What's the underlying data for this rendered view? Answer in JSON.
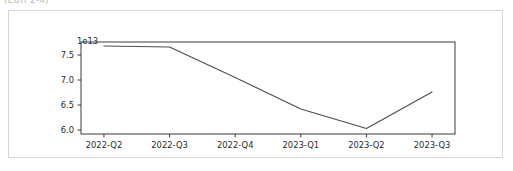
{
  "caption": {
    "clipped_text": "(EUR 2-4)"
  },
  "chart_data": {
    "type": "line",
    "title": "",
    "subtitle": "",
    "xlabel": "",
    "ylabel": "",
    "y_offset_text": "1e13",
    "y_offset_multiplier": 10000000000000.0,
    "categories": [
      "2022-Q2",
      "2022-Q3",
      "2022-Q4",
      "2023-Q1",
      "2023-Q2",
      "2023-Q3"
    ],
    "values": [
      7.68,
      7.66,
      7.05,
      6.42,
      6.03,
      6.76
    ],
    "series": [
      {
        "name": "series-1",
        "color": "#4d4d4d",
        "values": [
          7.68,
          7.66,
          7.05,
          6.42,
          6.03,
          6.76
        ]
      }
    ],
    "x_tick_labels": [
      "2022-Q2",
      "2022-Q3",
      "2022-Q4",
      "2023-Q1",
      "2023-Q2",
      "2023-Q3"
    ],
    "y_tick_labels": [
      "7.5",
      "7.0",
      "6.5",
      "6.0"
    ],
    "y_tick_values": [
      7.5,
      7.0,
      6.5,
      6.0
    ],
    "ylim": [
      5.92,
      7.76
    ],
    "xlim": [
      -0.35,
      5.35
    ],
    "grid": false,
    "legend": false,
    "legend_position": "none",
    "line_width": 1.1,
    "markers": "none",
    "annotations": []
  },
  "axis": {
    "y_ticks": [
      {
        "label": "7.5",
        "value": 7.5
      },
      {
        "label": "7.0",
        "value": 7.0
      },
      {
        "label": "6.5",
        "value": 6.5
      },
      {
        "label": "6.0",
        "value": 6.0
      }
    ],
    "x_ticks": [
      {
        "label": "2022-Q2",
        "index": 0
      },
      {
        "label": "2022-Q3",
        "index": 1
      },
      {
        "label": "2022-Q4",
        "index": 2
      },
      {
        "label": "2023-Q1",
        "index": 3
      },
      {
        "label": "2023-Q2",
        "index": 4
      },
      {
        "label": "2023-Q3",
        "index": 5
      }
    ],
    "offset_text": "1e13"
  },
  "colors": {
    "line": "#4d4d4d",
    "axis": "#3a3a3a",
    "text": "#2b2b2b",
    "card_border": "#d7d7d7",
    "background": "#ffffff"
  }
}
